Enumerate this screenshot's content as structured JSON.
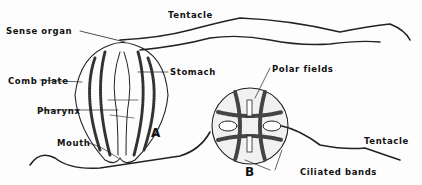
{
  "figure": {
    "views": [
      {
        "id": "A",
        "label": "A"
      },
      {
        "id": "B",
        "label": "B"
      }
    ],
    "labels": {
      "sense_organ": "Sense organ",
      "tentacle_top": "Tentacle",
      "stomach": "Stomach",
      "comb_plate": "Comb plate",
      "pharynx": "Pharynx",
      "mouth": "Mouth",
      "polar_fields": "Polar fields",
      "tentacle_right": "Tentacle",
      "ciliated_bands": "Ciliated bands"
    }
  }
}
